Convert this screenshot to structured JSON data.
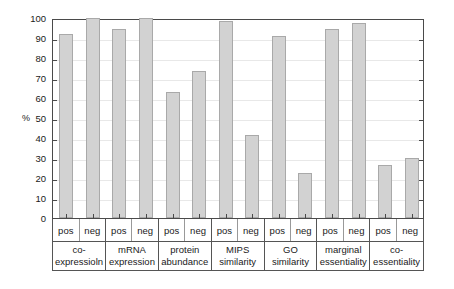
{
  "chart_data": {
    "type": "bar",
    "title": "",
    "xlabel": "",
    "ylabel": "%",
    "ylim": [
      0,
      100
    ],
    "ytick_step": 10,
    "yticks": [
      100,
      90,
      80,
      70,
      60,
      50,
      40,
      30,
      20,
      10,
      0
    ],
    "grid": true,
    "legend": "none",
    "bar_color": "#d2d2d2",
    "bar_border_color": "#a9a9a9",
    "axis_color": "#4a4a4a",
    "gridline_color": "#e8e8e8",
    "subcategories": [
      "pos",
      "neg"
    ],
    "categories": [
      "co-expressioln",
      "mRNA expression",
      "protein abundance",
      "MIPS similarity",
      "GO similarity",
      "marginal essentiality",
      "co-essentiality"
    ],
    "groups": [
      {
        "label_lines": [
          "co-",
          "expressioln"
        ],
        "bars": [
          {
            "subcategory": "pos",
            "value": 92
          },
          {
            "subcategory": "neg",
            "value": 100
          }
        ]
      },
      {
        "label_lines": [
          "mRNA",
          "expression"
        ],
        "bars": [
          {
            "subcategory": "pos",
            "value": 94.5
          },
          {
            "subcategory": "neg",
            "value": 100
          }
        ]
      },
      {
        "label_lines": [
          "protein",
          "abundance"
        ],
        "bars": [
          {
            "subcategory": "pos",
            "value": 63
          },
          {
            "subcategory": "neg",
            "value": 73.5
          }
        ]
      },
      {
        "label_lines": [
          "MIPS",
          "similarity"
        ],
        "bars": [
          {
            "subcategory": "pos",
            "value": 98.5
          },
          {
            "subcategory": "neg",
            "value": 41.5
          }
        ]
      },
      {
        "label_lines": [
          "GO",
          "similarity"
        ],
        "bars": [
          {
            "subcategory": "pos",
            "value": 91
          },
          {
            "subcategory": "neg",
            "value": 22.5
          }
        ]
      },
      {
        "label_lines": [
          "marginal",
          "essentiality"
        ],
        "bars": [
          {
            "subcategory": "pos",
            "value": 94.5
          },
          {
            "subcategory": "neg",
            "value": 97.5
          }
        ]
      },
      {
        "label_lines": [
          "co-",
          "essentiality"
        ],
        "bars": [
          {
            "subcategory": "pos",
            "value": 26.5
          },
          {
            "subcategory": "neg",
            "value": 30
          }
        ]
      }
    ]
  }
}
